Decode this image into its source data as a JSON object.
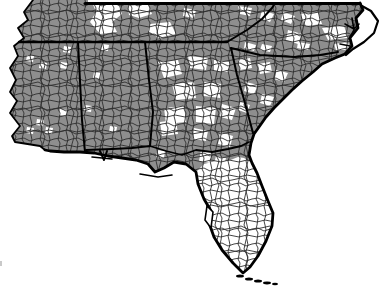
{
  "map": {
    "aria_label": "County-level map of the southeastern United States with gray shaded counties and white unshaded counties",
    "region": "Southeastern United States",
    "map_type": "two-tone county choropleth",
    "states_visible": [
      "Tennessee",
      "North Carolina",
      "Mississippi",
      "Alabama",
      "Georgia",
      "South Carolina",
      "Florida"
    ],
    "shading": {
      "shaded_value": "gray",
      "unshaded_value": "white",
      "mostly_shaded_areas": [
        "Mississippi",
        "Alabama",
        "Tennessee",
        "western North Carolina",
        "South Carolina",
        "southern Georgia",
        "Florida panhandle"
      ],
      "mostly_unshaded_areas": [
        "Florida peninsula",
        "north-central Georgia",
        "middle Tennessee cluster",
        "eastern North Carolina patches"
      ]
    },
    "colors": {
      "shaded_county_fill": "#8e8e8e",
      "unshaded_county_fill": "#ffffff",
      "county_border": "#2e2e2e",
      "state_border": "#000000",
      "coastline": "#000000",
      "water_background": "#ffffff"
    }
  }
}
